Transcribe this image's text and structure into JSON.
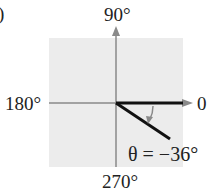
{
  "figure": {
    "partial_label": ")",
    "axes": {
      "top": "90°",
      "left": "180°",
      "right": "0",
      "bottom": "270°"
    },
    "angle": {
      "symbol": "θ",
      "label": "θ = −36°",
      "degrees": -36,
      "direction": "clockwise"
    },
    "colors": {
      "background_square": "#ececec",
      "axis": "#8a8a8a",
      "terminal_side": "#111111",
      "arc_arrow": "#8a8a8a"
    }
  }
}
